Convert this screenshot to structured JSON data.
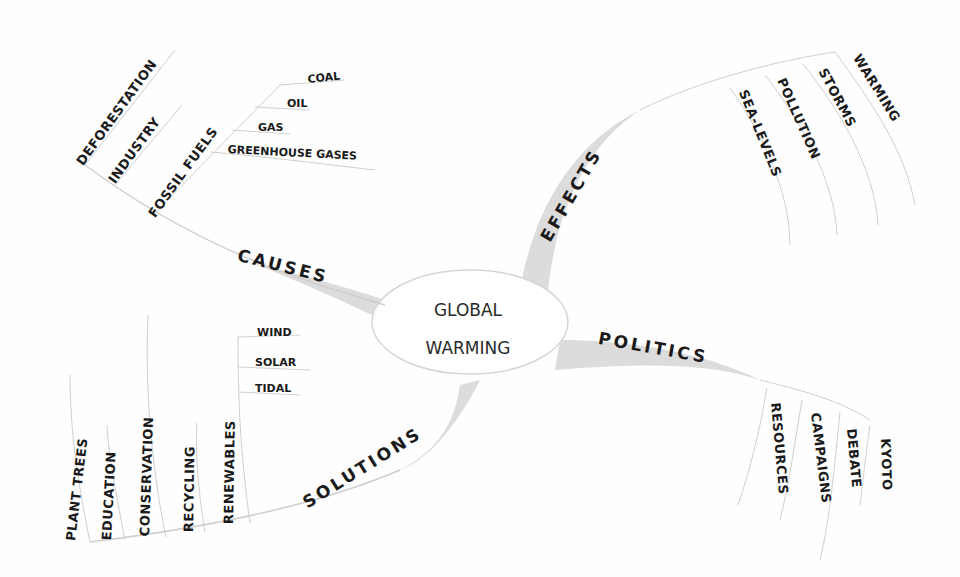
{
  "center": {
    "line1": "GLOBAL",
    "line2": "WARMING"
  },
  "branches": {
    "causes": {
      "label": "CAUSES",
      "items": [
        "DEFORESTATION",
        "INDUSTRY",
        "FOSSIL FUELS"
      ],
      "fossil_fuels_items": [
        "COAL",
        "OIL",
        "GAS",
        "GREENHOUSE GASES"
      ]
    },
    "effects": {
      "label": "EFFECTS",
      "items": [
        "SEA-LEVELS",
        "POLLUTION",
        "STORMS",
        "WARMING"
      ]
    },
    "politics": {
      "label": "POLITICS",
      "items": [
        "RESOURCES",
        "CAMPAIGNS",
        "DEBATE",
        "KYOTO"
      ]
    },
    "solutions": {
      "label": "SOLUTIONS",
      "items": [
        "PLANT TREES",
        "EDUCATION",
        "CONSERVATION",
        "RECYCLING",
        "RENEWABLES"
      ],
      "renewables_items": [
        "WIND",
        "SOLAR",
        "TIDAL"
      ]
    }
  },
  "colors": {
    "branch_fill": "#d9d9d9",
    "line": "#cfcfcf",
    "text": "#1a1a1a"
  }
}
